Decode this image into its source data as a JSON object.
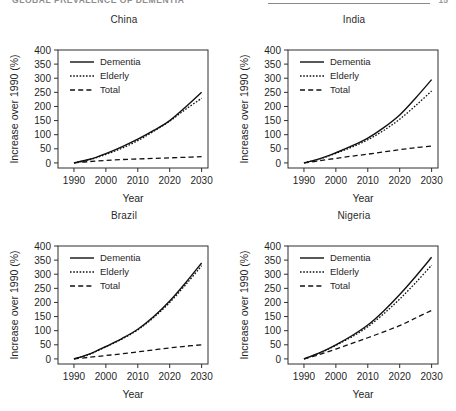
{
  "running_head": {
    "text": "GLOBAL PREVALENCE OF DEMENTIA",
    "page_number": "15"
  },
  "axis": {
    "ylabel": "Increase over 1990 (%)",
    "xlabel": "Year",
    "yticks": [
      "0",
      "50",
      "100",
      "150",
      "200",
      "250",
      "300",
      "350",
      "400"
    ],
    "xticks": [
      "1990",
      "2000",
      "2010",
      "2020",
      "2030"
    ]
  },
  "legend": {
    "dementia": "Dementia",
    "elderly": "Elderly",
    "total": "Total"
  },
  "chart_data": [
    {
      "type": "line",
      "title": "China",
      "xlabel": "Year",
      "ylabel": "Increase over 1990 (%)",
      "xlim": [
        1985,
        2032
      ],
      "ylim": [
        -18,
        400
      ],
      "xticks": [
        1990,
        2000,
        2010,
        2020,
        2030
      ],
      "yticks": [
        0,
        50,
        100,
        150,
        200,
        250,
        300,
        350,
        400
      ],
      "grid": false,
      "legend_position": "upper left",
      "x": [
        1990,
        1995,
        2000,
        2005,
        2010,
        2015,
        2020,
        2025,
        2030
      ],
      "series": [
        {
          "name": "Dementia",
          "style": "solid",
          "values": [
            0,
            13,
            33,
            57,
            84,
            115,
            150,
            198,
            250
          ]
        },
        {
          "name": "Elderly",
          "style": "dotted",
          "values": [
            0,
            12,
            30,
            52,
            79,
            112,
            148,
            190,
            229
          ]
        },
        {
          "name": "Total",
          "style": "dashed",
          "values": [
            0,
            5,
            9,
            12,
            14,
            16,
            18,
            20,
            22
          ]
        }
      ]
    },
    {
      "type": "line",
      "title": "India",
      "xlabel": "Year",
      "ylabel": "Increase over 1990 (%)",
      "xlim": [
        1985,
        2032
      ],
      "ylim": [
        -18,
        400
      ],
      "xticks": [
        1990,
        2000,
        2010,
        2020,
        2030
      ],
      "yticks": [
        0,
        50,
        100,
        150,
        200,
        250,
        300,
        350,
        400
      ],
      "grid": false,
      "legend_position": "upper left",
      "x": [
        1990,
        1995,
        2000,
        2005,
        2010,
        2015,
        2020,
        2025,
        2030
      ],
      "series": [
        {
          "name": "Dementia",
          "style": "solid",
          "values": [
            0,
            15,
            36,
            60,
            88,
            125,
            170,
            230,
            295
          ]
        },
        {
          "name": "Elderly",
          "style": "dotted",
          "values": [
            0,
            14,
            34,
            56,
            82,
            115,
            155,
            203,
            255
          ]
        },
        {
          "name": "Total",
          "style": "dashed",
          "values": [
            0,
            8,
            16,
            24,
            31,
            39,
            47,
            54,
            60
          ]
        }
      ]
    },
    {
      "type": "line",
      "title": "Brazil",
      "xlabel": "Year",
      "ylabel": "Increase over 1990 (%)",
      "xlim": [
        1985,
        2032
      ],
      "ylim": [
        -18,
        400
      ],
      "xticks": [
        1990,
        2000,
        2010,
        2020,
        2030
      ],
      "yticks": [
        0,
        50,
        100,
        150,
        200,
        250,
        300,
        350,
        400
      ],
      "grid": false,
      "legend_position": "upper left",
      "x": [
        1990,
        1995,
        2000,
        2005,
        2010,
        2015,
        2020,
        2025,
        2030
      ],
      "series": [
        {
          "name": "Dementia",
          "style": "solid",
          "values": [
            0,
            18,
            44,
            72,
            105,
            150,
            205,
            270,
            340
          ]
        },
        {
          "name": "Elderly",
          "style": "dotted",
          "values": [
            0,
            17,
            43,
            70,
            103,
            147,
            200,
            263,
            330
          ]
        },
        {
          "name": "Total",
          "style": "dashed",
          "values": [
            0,
            6,
            12,
            18,
            25,
            32,
            39,
            45,
            50
          ]
        }
      ]
    },
    {
      "type": "line",
      "title": "Nigeria",
      "xlabel": "Year",
      "ylabel": "Increase over 1990 (%)",
      "xlim": [
        1985,
        2032
      ],
      "ylim": [
        -18,
        400
      ],
      "xticks": [
        1990,
        2000,
        2010,
        2020,
        2030
      ],
      "yticks": [
        0,
        50,
        100,
        150,
        200,
        250,
        300,
        350,
        400
      ],
      "grid": false,
      "legend_position": "upper left",
      "x": [
        1990,
        1995,
        2000,
        2005,
        2010,
        2015,
        2020,
        2025,
        2030
      ],
      "series": [
        {
          "name": "Dementia",
          "style": "solid",
          "values": [
            0,
            22,
            50,
            82,
            120,
            170,
            228,
            292,
            360
          ]
        },
        {
          "name": "Elderly",
          "style": "dotted",
          "values": [
            0,
            21,
            48,
            78,
            114,
            160,
            212,
            270,
            332
          ]
        },
        {
          "name": "Total",
          "style": "dashed",
          "values": [
            0,
            16,
            35,
            55,
            75,
            96,
            118,
            145,
            172
          ]
        }
      ]
    }
  ]
}
